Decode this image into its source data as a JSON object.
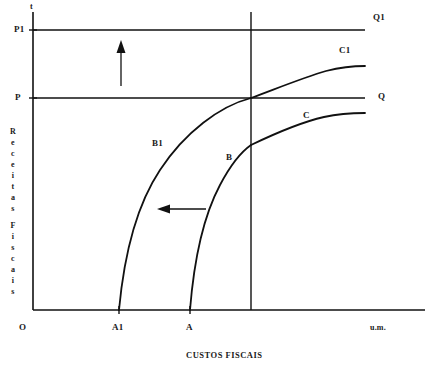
{
  "figure": {
    "caption": "CUSTOS FISCAIS",
    "axis_vertical_label": "Receitas Fiscais",
    "axis_vertical_top_symbol": "t",
    "axis_horizontal_unit": "u.m.",
    "origin_label": "O"
  },
  "axes": {
    "y_ticks": [
      {
        "label": "P1",
        "y": 30
      },
      {
        "label": "P",
        "y": 98
      }
    ],
    "x_ticks": [
      {
        "label": "A1",
        "x": 119
      },
      {
        "label": "A",
        "x": 190
      }
    ]
  },
  "curve_labels": [
    {
      "id": "B1",
      "label": "B1",
      "x": 152,
      "y": 138
    },
    {
      "id": "B",
      "label": "B",
      "x": 226,
      "y": 152
    },
    {
      "id": "C1",
      "label": "C1",
      "x": 339,
      "y": 47
    },
    {
      "id": "C",
      "label": "C",
      "x": 303,
      "y": 111
    },
    {
      "id": "Q1",
      "label": "Q1",
      "x": 373,
      "y": 13
    },
    {
      "id": "Q",
      "label": "Q",
      "x": 378,
      "y": 92
    }
  ],
  "arrows": [
    {
      "id": "shift-up-arrow",
      "direction": "up"
    },
    {
      "id": "shift-left-arrow",
      "direction": "left"
    }
  ],
  "colors": {
    "ink": "#111111",
    "background": "#ffffff"
  },
  "chart_data": {
    "type": "line",
    "title": "",
    "xlabel": "CUSTOS FISCAIS",
    "ylabel": "Receitas Fiscais",
    "xlim": [
      0,
      400
    ],
    "ylim": [
      0,
      300
    ],
    "grid": false,
    "legend": "inline-annotations",
    "annotations": [
      "P1",
      "P",
      "A1",
      "A",
      "O",
      "u.m.",
      "t"
    ],
    "series": [
      {
        "name": "B1",
        "comment": "Curva de receita deslocada (esquerda/superior), do eixo x em A1 ate a interseccao em (A_line, P)",
        "points": [
          [
            119,
            0
          ],
          [
            127,
            60
          ],
          [
            142,
            110
          ],
          [
            163,
            155
          ],
          [
            190,
            190
          ],
          [
            222,
            208
          ],
          [
            251,
            212
          ]
        ]
      },
      {
        "name": "C1",
        "comment": "Prolongamento de B1 para a direita da linha vertical, aproximando-se de Q1",
        "points": [
          [
            251,
            212
          ],
          [
            280,
            228
          ],
          [
            310,
            238
          ],
          [
            340,
            242
          ],
          [
            365,
            244
          ]
        ]
      },
      {
        "name": "B",
        "comment": "Curva de receita original, do eixo x em A ate a linha vertical",
        "points": [
          [
            190,
            0
          ],
          [
            198,
            55
          ],
          [
            212,
            105
          ],
          [
            230,
            145
          ],
          [
            251,
            165
          ]
        ]
      },
      {
        "name": "C",
        "comment": "Prolongamento de B para a direita da linha vertical, aproximando-se de Q",
        "points": [
          [
            251,
            165
          ],
          [
            280,
            183
          ],
          [
            310,
            192
          ],
          [
            340,
            196
          ],
          [
            365,
            197
          ]
        ]
      },
      {
        "name": "Q1",
        "comment": "Linha horizontal do nivel de receita P1",
        "points": [
          [
            0,
            280
          ],
          [
            365,
            280
          ]
        ]
      },
      {
        "name": "Q",
        "comment": "Linha horizontal do nivel de receita P",
        "points": [
          [
            0,
            212
          ],
          [
            365,
            212
          ]
        ]
      },
      {
        "name": "vertical-reference",
        "comment": "Linha vertical de referencia passando pela interseccao",
        "points": [
          [
            251,
            0
          ],
          [
            251,
            298
          ]
        ]
      }
    ]
  }
}
